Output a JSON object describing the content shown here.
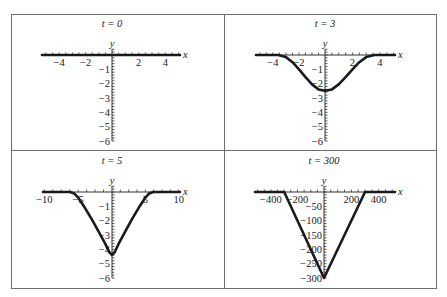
{
  "figure": {
    "panels": [
      {
        "title": "t = 0",
        "x_label": "x",
        "y_label": "y"
      },
      {
        "title": "t = 3",
        "x_label": "x",
        "y_label": "y"
      },
      {
        "title": "t = 5",
        "x_label": "x",
        "y_label": "y"
      },
      {
        "title": "t = 300",
        "x_label": "x",
        "y_label": "y"
      }
    ]
  },
  "chart_data": [
    {
      "type": "line",
      "title": "t = 0",
      "xlabel": "x",
      "ylabel": "y",
      "xlim": [
        -5.3,
        5.1
      ],
      "ylim": [
        -6,
        0.4
      ],
      "x_ticks": [
        -4,
        -2,
        2,
        4
      ],
      "y_ticks": [
        -1,
        -2,
        -3,
        -4,
        -5,
        -6
      ],
      "x": [
        -5.3,
        5.1
      ],
      "y": [
        0,
        0
      ]
    },
    {
      "type": "line",
      "title": "t = 3",
      "xlabel": "x",
      "ylabel": "y",
      "xlim": [
        -5.3,
        5.1
      ],
      "ylim": [
        -6,
        0.4
      ],
      "x_ticks": [
        -4,
        -2,
        2,
        4
      ],
      "y_ticks": [
        -1,
        -2,
        -3,
        -4,
        -5,
        -6
      ],
      "x": [
        -5.3,
        -3.6,
        -3,
        -2.5,
        -2,
        -1.5,
        -1,
        -0.5,
        0,
        0.5,
        1,
        1.5,
        2,
        2.5,
        3,
        3.6,
        5.1
      ],
      "y": [
        0,
        0,
        -0.15,
        -0.5,
        -1.0,
        -1.55,
        -2.05,
        -2.4,
        -2.5,
        -2.4,
        -2.05,
        -1.55,
        -1.0,
        -0.5,
        -0.15,
        0,
        0
      ]
    },
    {
      "type": "line",
      "title": "t = 5",
      "xlabel": "x",
      "ylabel": "y",
      "xlim": [
        -10.2,
        10.2
      ],
      "ylim": [
        -6,
        0.4
      ],
      "x_ticks": [
        -10,
        -5,
        5,
        10
      ],
      "y_ticks": [
        -1,
        -2,
        -3,
        -4,
        -5,
        -6
      ],
      "x": [
        -10.2,
        -6.2,
        -5.6,
        -5,
        -4,
        -3,
        -2,
        -1,
        -0.4,
        0,
        0.4,
        1,
        2,
        3,
        4,
        5,
        5.6,
        6.2,
        10.2
      ],
      "y": [
        0,
        0,
        -0.1,
        -0.4,
        -1.1,
        -1.9,
        -2.75,
        -3.6,
        -4.2,
        -4.4,
        -4.2,
        -3.6,
        -2.75,
        -1.9,
        -1.1,
        -0.4,
        -0.1,
        0,
        0
      ]
    },
    {
      "type": "line",
      "title": "t = 300",
      "xlabel": "x",
      "ylabel": "y",
      "xlim": [
        -520,
        520
      ],
      "ylim": [
        -300,
        20
      ],
      "x_ticks": [
        -400,
        -200,
        200,
        400
      ],
      "y_ticks": [
        -50,
        -100,
        -150,
        -200,
        -250,
        -300
      ],
      "x": [
        -520,
        -300,
        0,
        300,
        520
      ],
      "y": [
        0,
        0,
        -300,
        0,
        0
      ]
    }
  ]
}
